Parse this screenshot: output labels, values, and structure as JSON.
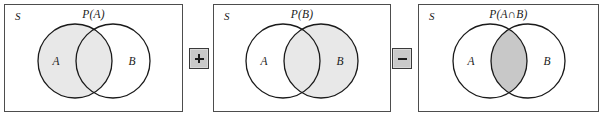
{
  "figure": {
    "type": "venn-diagram-equation",
    "colors": {
      "panel_border": "#4d4d4d",
      "circle_stroke": "#1a1a1a",
      "circle_shade": "#e8e8e8",
      "intersection_shade": "#c8c8c8",
      "operator_box_fill": "#c9c9c9",
      "operator_box_border": "#3a3a3a",
      "text": "#1a1a1a",
      "background": "#ffffff"
    }
  },
  "panels": [
    {
      "id": "panel-1",
      "space_label": "S",
      "probability_label": "P(A)",
      "set_a_label": "A",
      "set_b_label": "B",
      "shaded_region": "A",
      "a_filled": true,
      "b_filled": false,
      "intersection_dark": false
    },
    {
      "id": "panel-2",
      "space_label": "S",
      "probability_label": "P(B)",
      "set_a_label": "A",
      "set_b_label": "B",
      "shaded_region": "B",
      "a_filled": false,
      "b_filled": true,
      "intersection_dark": false
    },
    {
      "id": "panel-3",
      "space_label": "S",
      "probability_label": "P(A∩B)",
      "probability_label_prefix": "P(A",
      "probability_label_operator": "∩",
      "probability_label_suffix": "B)",
      "set_a_label": "A",
      "set_b_label": "B",
      "shaded_region": "A∩B",
      "a_filled": false,
      "b_filled": false,
      "intersection_dark": true
    }
  ],
  "operators": [
    {
      "id": "op-plus",
      "symbol": "+",
      "name": "plus"
    },
    {
      "id": "op-minus",
      "symbol": "−",
      "name": "minus"
    }
  ]
}
